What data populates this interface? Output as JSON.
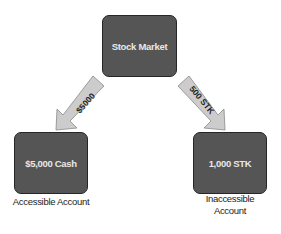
{
  "diagram": {
    "nodes": {
      "market": {
        "label": "Stock Market"
      },
      "cash": {
        "label": "$5,000 Cash",
        "caption": "Accessible Account"
      },
      "stk": {
        "label": "1,000 STK",
        "caption_line1": "Inaccessible",
        "caption_line2": "Account"
      }
    },
    "edges": [
      {
        "from": "Stock Market",
        "to": "$5,000 Cash",
        "label": "$5000"
      },
      {
        "from": "Stock Market",
        "to": "1,000 STK",
        "label": "500 STK"
      }
    ],
    "colors": {
      "node_fill": "#555555",
      "node_border": "#262626",
      "arrow_fill": "#cccccc",
      "arrow_border": "#8a8a8a"
    }
  }
}
